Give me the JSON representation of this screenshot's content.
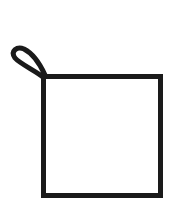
{
  "drawing": {
    "subject": "square with loop at top-left corner (pot holder)",
    "stroke_color": "#1a1a1a",
    "background_color": "#ffffff",
    "stroke_width": 5,
    "square": {
      "x": 43.5,
      "y": 76.5,
      "width": 117,
      "height": 119
    },
    "loop": {
      "attach_x": 44,
      "attach_y": 77,
      "tip_x": 15,
      "tip_y": 50
    }
  }
}
